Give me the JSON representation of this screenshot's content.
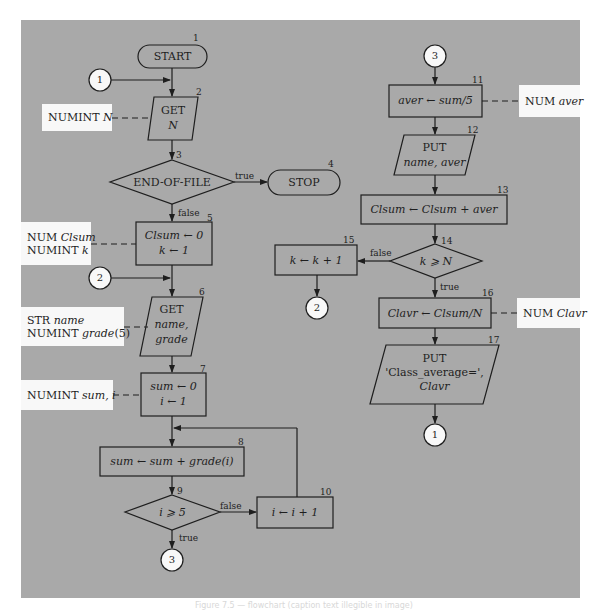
{
  "figure": {
    "panel_color": "#a9a9a9",
    "decl_box_color": "#f8f8f8",
    "line_color": "#1e1e1e",
    "caption": "Figure 7.5 — flowchart (caption text illegible in image)"
  },
  "nodes": {
    "start": {
      "step": "1",
      "label": "START"
    },
    "get_n": {
      "step": "2",
      "line1": "GET",
      "line2": "N"
    },
    "eof": {
      "step": "3",
      "label": "END-OF-FILE",
      "true_label": "true",
      "false_label": "false"
    },
    "stop": {
      "step": "4",
      "label": "STOP"
    },
    "init_clsum": {
      "step": "5",
      "line1": "Clsum ← 0",
      "line2": "k ← 1"
    },
    "get_name_grade": {
      "step": "6",
      "line1": "GET",
      "line2": "name,",
      "line3": "grade"
    },
    "init_sum": {
      "step": "7",
      "line1": "sum ← 0",
      "line2": "i ← 1"
    },
    "accumulate": {
      "step": "8",
      "label": "sum ← sum + grade(i)"
    },
    "test_i": {
      "step": "9",
      "label": "i ⩾ 5",
      "true_label": "true",
      "false_label": "false"
    },
    "incr_i": {
      "step": "10",
      "label": "i ← i + 1"
    },
    "aver": {
      "step": "11",
      "label": "aver ← sum/5"
    },
    "put_name_aver": {
      "step": "12",
      "line1": "PUT",
      "line2": "name, aver"
    },
    "clsum_add": {
      "step": "13",
      "label": "Clsum ← Clsum + aver"
    },
    "test_k": {
      "step": "14",
      "label": "k ⩾ N",
      "true_label": "true",
      "false_label": "false"
    },
    "incr_k": {
      "step": "15",
      "label": "k ← k + 1"
    },
    "clavr": {
      "step": "16",
      "label": "Clavr ← Clsum/N"
    },
    "put_class_avg": {
      "step": "17",
      "line1": "PUT",
      "line2": "'Class_average=',",
      "line3": "Clavr"
    }
  },
  "connectors": {
    "c1_in": "1",
    "c2_in": "2",
    "c3_out": "3",
    "c3_in": "3",
    "c2_out": "2",
    "c1_out": "1"
  },
  "declarations": {
    "numint_n": {
      "kw": "NUMINT",
      "var": "N"
    },
    "clsum_k": {
      "kw1": "NUM",
      "var1": "Clsum",
      "kw2": "NUMINT",
      "var2": "k"
    },
    "name_grade": {
      "kw1": "STR",
      "var1": "name",
      "kw2": "NUMINT",
      "var2": "grade",
      "suffix2": "(5)"
    },
    "sum_i": {
      "kw": "NUMINT",
      "var": "sum, i"
    },
    "aver": {
      "kw": "NUM",
      "var": "aver"
    },
    "clavr": {
      "kw": "NUM",
      "var": "Clavr"
    }
  }
}
